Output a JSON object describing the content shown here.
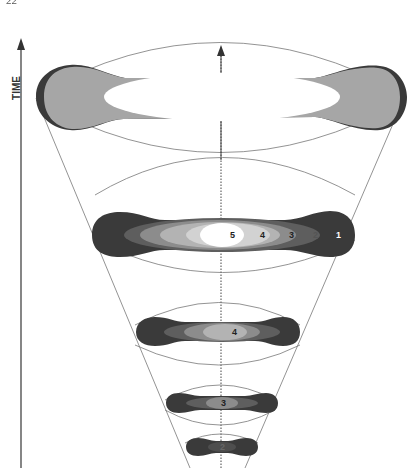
{
  "header": {
    "page_number": "22",
    "title": "",
    "note": "header partially cropped and illegible"
  },
  "axis": {
    "label": "TIME"
  },
  "layers": [
    {
      "name": "top-layer",
      "labels": []
    },
    {
      "name": "second-layer",
      "labels": [
        "5",
        "4",
        "3",
        "2",
        "1"
      ]
    },
    {
      "name": "third-layer",
      "labels": [
        "4"
      ]
    },
    {
      "name": "fourth-layer",
      "labels": [
        "3"
      ]
    },
    {
      "name": "bottom-layer",
      "labels": [
        "2"
      ]
    }
  ],
  "colors": {
    "darkest": "#3a3a3a",
    "dark": "#5e5e5e",
    "mid": "#8c8c8c",
    "light": "#b3b3b3",
    "lighter": "#d2d2d2",
    "white": "#ffffff",
    "outline": "#777777"
  }
}
